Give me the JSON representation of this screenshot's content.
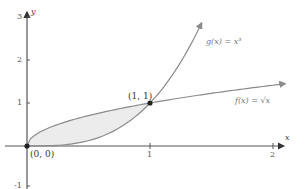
{
  "chart_data": {
    "type": "line",
    "title": "",
    "xlabel": "x",
    "ylabel": "y",
    "xlim": [
      0,
      2.1
    ],
    "ylim": [
      -1,
      3.2
    ],
    "grid": false,
    "x_ticks": [
      "1",
      "2"
    ],
    "y_ticks": [
      "-1",
      "1",
      "2",
      "3"
    ],
    "series": [
      {
        "name": "f(x) = √x",
        "label": "f(x) = √x",
        "formula": "sqrt(x)",
        "x": [
          0,
          0.25,
          0.5,
          1,
          1.5,
          2
        ],
        "values": [
          0,
          0.5,
          0.71,
          1,
          1.22,
          1.41
        ]
      },
      {
        "name": "g(x) = x³",
        "label": "g(x) = x³",
        "formula": "x^3",
        "x": [
          0,
          0.5,
          1,
          1.2,
          1.4
        ],
        "values": [
          0,
          0.125,
          1,
          1.73,
          2.74
        ]
      }
    ],
    "shaded_region": {
      "between": [
        "f(x) = √x",
        "g(x) = x³"
      ],
      "x_range": [
        0,
        1
      ]
    },
    "annotations": [
      {
        "text": "(0, 0)",
        "x": 0,
        "y": 0
      },
      {
        "text": "(1, 1)",
        "x": 1,
        "y": 1
      }
    ]
  },
  "labels": {
    "y_axis": "y",
    "x_axis": "x",
    "tick_y3": "3",
    "tick_y2": "2",
    "tick_y1": "1",
    "tick_yneg1": "-1",
    "tick_x1": "1",
    "tick_x2": "2",
    "g_label": "g(x) = x³",
    "f_label": "f(x) = √x",
    "point_origin": "(0, 0)",
    "point_intersect": "(1, 1)"
  },
  "colors": {
    "curve": "#8a8a8a",
    "axis": "#555555",
    "shade": "#ececec",
    "point": "#222222"
  }
}
